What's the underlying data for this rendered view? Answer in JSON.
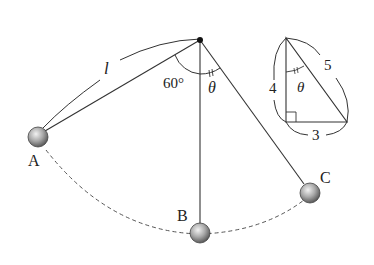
{
  "diagram": {
    "title": "",
    "pendulum": {
      "length_label": "l",
      "angle_A_label": "60°",
      "angle_C_label": "θ",
      "points": [
        {
          "id": "A",
          "label": "A"
        },
        {
          "id": "B",
          "label": "B"
        },
        {
          "id": "C",
          "label": "C"
        }
      ]
    },
    "inset_triangle": {
      "side_vertical": "4",
      "side_hypotenuse": "5",
      "side_horizontal": "3",
      "angle_label": "θ"
    },
    "colors": {
      "line": "#333333",
      "ball": "#9a9a9a",
      "background": "#ffffff"
    }
  }
}
